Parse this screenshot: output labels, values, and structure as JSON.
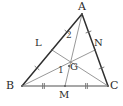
{
  "figure": {
    "name": "triangle-centroid-medians",
    "width": 123,
    "height": 106,
    "background_color": "#ffffff"
  },
  "style": {
    "triangle_stroke": "#2f2f2f",
    "triangle_stroke_width": 1.5,
    "median_stroke": "#8c8c8c",
    "median_stroke_width": 0.9,
    "base_stroke": "#8a8a8a",
    "base_stroke_width": 1.6,
    "tick_stroke": "#6e6e6e",
    "tick_stroke_width": 0.9,
    "point_fill": "#555555",
    "label_color": "#2b2b2b"
  },
  "points": {
    "A": {
      "label": "A",
      "x": 82,
      "y": 14,
      "label_x": 78,
      "label_y": 1
    },
    "B": {
      "label": "B",
      "x": 22,
      "y": 86,
      "label_x": 6,
      "label_y": 80
    },
    "C": {
      "label": "C",
      "x": 108,
      "y": 86,
      "label_x": 110,
      "label_y": 80
    },
    "L": {
      "label": "L",
      "x": 52,
      "y": 50,
      "label_x": 35,
      "label_y": 38
    },
    "N": {
      "label": "N",
      "x": 95,
      "y": 50,
      "label_x": 94,
      "label_y": 38
    },
    "M": {
      "label": "M",
      "x": 65,
      "y": 86,
      "label_x": 59,
      "label_y": 90
    },
    "G": {
      "label": "G",
      "x": 69,
      "y": 66,
      "label_x": 70,
      "label_y": 62
    }
  },
  "angles": [
    {
      "name": "angle-1",
      "label": "1",
      "x": 58,
      "y": 66
    },
    {
      "name": "angle-2",
      "label": "2",
      "x": 66,
      "y": 31
    }
  ],
  "segments": [
    {
      "name": "side-ab",
      "from": "A",
      "to": "B",
      "kind": "triangle"
    },
    {
      "name": "side-ac",
      "from": "A",
      "to": "C",
      "kind": "triangle"
    },
    {
      "name": "side-bc",
      "from": "B",
      "to": "C",
      "kind": "base"
    },
    {
      "name": "median-am",
      "from": "A",
      "to": "M",
      "kind": "median"
    },
    {
      "name": "median-bn",
      "from": "B",
      "to": "N",
      "kind": "median"
    },
    {
      "name": "median-cl",
      "from": "C",
      "to": "L",
      "kind": "median"
    }
  ],
  "tick_marks": [
    {
      "name": "tick-bm",
      "segment": "B-M",
      "count": 2
    },
    {
      "name": "tick-mc",
      "segment": "M-C",
      "count": 2
    },
    {
      "name": "tick-bl",
      "segment": "B-L",
      "count": 1
    },
    {
      "name": "tick-la",
      "segment": "L-A",
      "count": 1
    },
    {
      "name": "tick-an",
      "segment": "A-N",
      "count": 1
    },
    {
      "name": "tick-nc",
      "segment": "N-C",
      "count": 1
    }
  ]
}
